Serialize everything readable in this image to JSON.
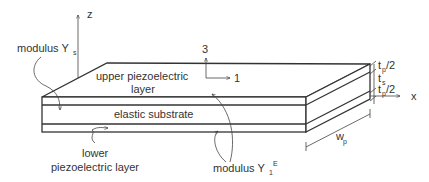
{
  "diagram": {
    "type": "layered-beam-schematic",
    "axes": {
      "global_z": "z",
      "global_x": "x",
      "local_3": "3",
      "local_1": "1"
    },
    "labels": {
      "upper_layer_line1": "upper piezoelectric",
      "upper_layer_line2": "layer",
      "substrate": "elastic substrate",
      "lower_layer_line1": "lower",
      "lower_layer_line2": "piezoelectric layer",
      "modulus_s_prefix": "modulus Y",
      "modulus_s_sub": "s",
      "modulus_1_prefix": "modulus Y",
      "modulus_1_sub": "1",
      "modulus_1_sup": "E"
    },
    "dimensions": {
      "tp_half_top": {
        "main": "t",
        "sub": "p",
        "suffix": "/2"
      },
      "ts": {
        "main": "t",
        "sub": "s"
      },
      "tp_half_bottom": {
        "main": "t",
        "sub": "p",
        "suffix": "/2"
      },
      "width": {
        "main": "w",
        "sub": "p"
      }
    },
    "colors": {
      "line": "#333333",
      "background": "#ffffff"
    }
  }
}
